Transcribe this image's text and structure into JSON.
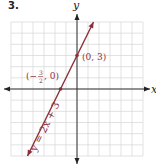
{
  "problem_number": "3.",
  "chart_data": {
    "type": "line",
    "title": "",
    "xlabel": "x",
    "ylabel": "y",
    "xlim": [
      -6,
      6
    ],
    "ylim": [
      -6,
      6
    ],
    "grid": true,
    "equation": "y = 2x + 3",
    "slope": 2,
    "intercept": 3,
    "line_color": "#8b2f3a",
    "line_x_range": [
      -4.5,
      1.5
    ],
    "points": [
      {
        "x": -1.5,
        "y": 0,
        "label": "(−3/2, 0)"
      },
      {
        "x": 0,
        "y": 3,
        "label": "(0, 3)"
      }
    ]
  }
}
